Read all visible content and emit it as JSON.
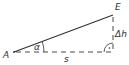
{
  "diagram": {
    "type": "right-triangle",
    "points": {
      "A": {
        "label": "A"
      },
      "E": {
        "label": "E"
      }
    },
    "angle_label": "α",
    "horizontal_label": "s",
    "vertical_label": "Δh",
    "right_angle_marker": "·",
    "colors": {
      "line": "#333333",
      "background": "#ffffff"
    }
  }
}
